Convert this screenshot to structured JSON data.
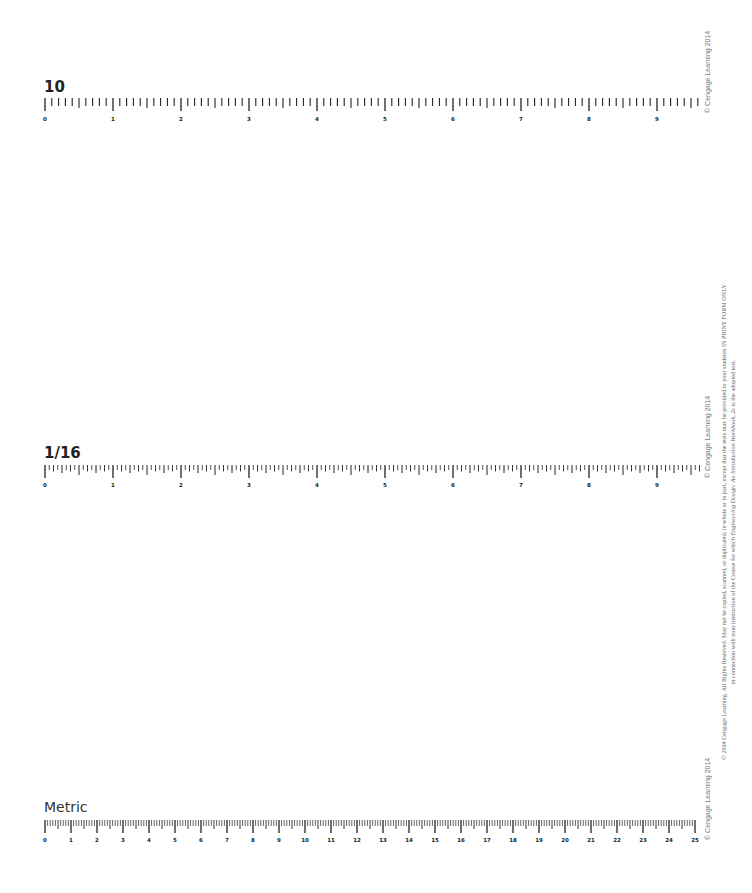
{
  "rulers": [
    {
      "id": "tenths",
      "title": "10",
      "unit": "inch",
      "divisions_per_unit": 10,
      "labels": [
        "0",
        "1",
        "2",
        "3",
        "4",
        "5",
        "6",
        "7",
        "8",
        "9"
      ],
      "origin_x": 45,
      "px_per_unit": 68,
      "length_units": 9.6,
      "title_y": 80,
      "tick_top": 98,
      "label_y": 121
    },
    {
      "id": "sixteenths",
      "title": "1/16",
      "unit": "inch",
      "divisions_per_unit": 16,
      "labels": [
        "0",
        "1",
        "2",
        "3",
        "4",
        "5",
        "6",
        "7",
        "8",
        "9"
      ],
      "origin_x": 45,
      "px_per_unit": 68,
      "length_units": 9.6,
      "title_y": 446,
      "tick_top": 465,
      "label_y": 487
    },
    {
      "id": "metric",
      "title": "Metric",
      "unit": "cm",
      "divisions_per_unit": 10,
      "labels": [
        "0",
        "1",
        "2",
        "3",
        "4",
        "5",
        "6",
        "7",
        "8",
        "9",
        "10",
        "11",
        "12",
        "13",
        "14",
        "15",
        "16",
        "17",
        "18",
        "19",
        "20",
        "21",
        "22",
        "23",
        "24",
        "25"
      ],
      "origin_x": 45,
      "px_per_unit": 26,
      "length_units": 25,
      "title_y": 800,
      "tick_top": 820,
      "label_y": 842
    }
  ],
  "credits": {
    "ruler_credit": "© Cengage Learning 2014"
  },
  "legal": {
    "line1": "© 2014 Cengage Learning. All Rights Reserved. May not be copied, scanned, or duplicated, in whole or in part, except that the tests may be provided to your students IN PRINT FORM ONLY",
    "line2_pre": "in connection with your instruction of the Course for which ",
    "line2_em": "Engineering Design: An Introduction Workbook, 2e",
    "line2_post": " is the adopted text."
  },
  "colors": {
    "ink": "#222222",
    "credit": "#777777"
  }
}
